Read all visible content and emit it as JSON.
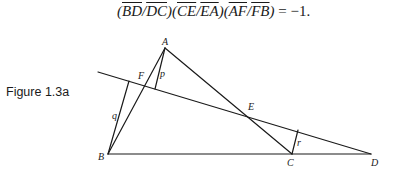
{
  "equation": {
    "parts": [
      {
        "type": "paren",
        "text": "("
      },
      {
        "type": "seg",
        "text": "BD"
      },
      {
        "type": "op",
        "text": "/"
      },
      {
        "type": "seg",
        "text": "DC"
      },
      {
        "type": "paren",
        "text": ")("
      },
      {
        "type": "seg",
        "text": "CE"
      },
      {
        "type": "op",
        "text": "/"
      },
      {
        "type": "seg",
        "text": "EA"
      },
      {
        "type": "paren",
        "text": ")("
      },
      {
        "type": "seg",
        "text": "AF"
      },
      {
        "type": "op",
        "text": "/"
      },
      {
        "type": "seg",
        "text": "FB"
      },
      {
        "type": "paren",
        "text": ")"
      },
      {
        "type": "eq",
        "text": " = −1."
      }
    ]
  },
  "caption": "Figure 1.3a",
  "figure": {
    "points": {
      "A": {
        "label": "A"
      },
      "B": {
        "label": "B"
      },
      "C": {
        "label": "C"
      },
      "D": {
        "label": "D"
      },
      "E": {
        "label": "E"
      },
      "F": {
        "label": "F"
      }
    },
    "perpendiculars": {
      "p": {
        "label": "p"
      },
      "q": {
        "label": "q"
      },
      "r": {
        "label": "r"
      }
    }
  }
}
